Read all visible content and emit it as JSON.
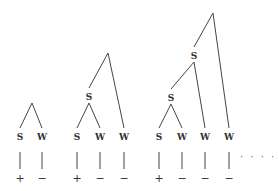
{
  "figure": {
    "title": "",
    "trees": [
      {
        "id": "tree-1",
        "nodes": [
          {
            "id": "r",
            "label": "",
            "x": 32,
            "y": 103
          },
          {
            "id": "s1",
            "label": "S",
            "x": 20,
            "y": 137
          },
          {
            "id": "w1",
            "label": "W",
            "x": 42,
            "y": 137
          }
        ],
        "edges": [
          [
            "r",
            "s1"
          ],
          [
            "r",
            "w1"
          ]
        ],
        "leaves": [
          {
            "node": "s1",
            "sign": "+"
          },
          {
            "node": "w1",
            "sign": "−"
          }
        ]
      },
      {
        "id": "tree-2",
        "nodes": [
          {
            "id": "r",
            "label": "",
            "x": 108,
            "y": 53
          },
          {
            "id": "sm",
            "label": "S",
            "x": 89,
            "y": 97
          },
          {
            "id": "s1",
            "label": "S",
            "x": 77,
            "y": 137
          },
          {
            "id": "w1",
            "label": "W",
            "x": 100,
            "y": 137
          },
          {
            "id": "w2",
            "label": "W",
            "x": 124,
            "y": 137
          }
        ],
        "edges": [
          [
            "r",
            "sm"
          ],
          [
            "r",
            "w2"
          ],
          [
            "sm",
            "s1"
          ],
          [
            "sm",
            "w1"
          ]
        ],
        "leaves": [
          {
            "node": "s1",
            "sign": "+"
          },
          {
            "node": "w1",
            "sign": "−"
          },
          {
            "node": "w2",
            "sign": "−"
          }
        ]
      },
      {
        "id": "tree-3",
        "nodes": [
          {
            "id": "r",
            "label": "",
            "x": 213,
            "y": 13
          },
          {
            "id": "su",
            "label": "S",
            "x": 194,
            "y": 56
          },
          {
            "id": "sm",
            "label": "S",
            "x": 171,
            "y": 98
          },
          {
            "id": "s1",
            "label": "S",
            "x": 159,
            "y": 137
          },
          {
            "id": "w1",
            "label": "W",
            "x": 182,
            "y": 137
          },
          {
            "id": "w2",
            "label": "W",
            "x": 205,
            "y": 137
          },
          {
            "id": "w3",
            "label": "W",
            "x": 229,
            "y": 137
          }
        ],
        "edges": [
          [
            "r",
            "su"
          ],
          [
            "r",
            "w3"
          ],
          [
            "su",
            "sm"
          ],
          [
            "su",
            "w2"
          ],
          [
            "sm",
            "s1"
          ],
          [
            "sm",
            "w1"
          ]
        ],
        "leaves": [
          {
            "node": "s1",
            "sign": "+"
          },
          {
            "node": "w1",
            "sign": "−"
          },
          {
            "node": "w2",
            "sign": "−"
          },
          {
            "node": "w3",
            "sign": "−"
          }
        ]
      }
    ],
    "continuation": {
      "text": "· · · ·",
      "x": 240,
      "y": 160
    }
  }
}
